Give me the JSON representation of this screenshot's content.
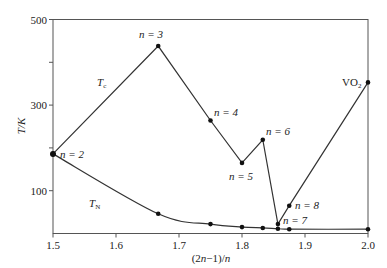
{
  "chart_data": {
    "type": "line",
    "title": "",
    "xlabel": "(2n−1)/n",
    "ylabel": "T/K",
    "xlim": [
      1.5,
      2.0
    ],
    "ylim": [
      0,
      500
    ],
    "xticks": [
      1.5,
      1.6,
      1.7,
      1.8,
      1.9,
      2.0
    ],
    "xtick_labels": [
      "1.5",
      "1.6",
      "1.7",
      "1.8",
      "1.9",
      "2.0"
    ],
    "yticks": [
      100,
      200,
      300,
      400,
      500
    ],
    "ytick_labels": [
      "100",
      "",
      "300",
      "",
      "500"
    ],
    "grid": false,
    "legend": "none (inline labels)",
    "series": [
      {
        "name": "T_c",
        "label_main": "T",
        "label_sub": "c",
        "x": [
          1.5,
          1.667,
          1.75,
          1.8,
          1.833,
          1.857,
          1.875,
          2.0
        ],
        "y": [
          186,
          438,
          264,
          165,
          219,
          22,
          65,
          353
        ],
        "point_labels": [
          "n = 2",
          "n = 3",
          "n = 4",
          "n = 5",
          "n = 6",
          "n = 7",
          "n = 8",
          "VO2"
        ]
      },
      {
        "name": "T_N",
        "label_main": "T",
        "label_sub": "N",
        "x": [
          1.5,
          1.667,
          1.75,
          1.8,
          1.833,
          1.857,
          1.875,
          2.0
        ],
        "y": [
          186,
          46,
          22,
          15,
          13,
          11,
          10,
          10
        ]
      }
    ],
    "annotations": [
      {
        "text": "n = 2",
        "x": 1.5,
        "y": 186
      },
      {
        "text": "n = 3",
        "x": 1.667,
        "y": 438
      },
      {
        "text": "n = 4",
        "x": 1.75,
        "y": 264
      },
      {
        "text": "n = 5",
        "x": 1.8,
        "y": 165
      },
      {
        "text": "n = 6",
        "x": 1.833,
        "y": 219
      },
      {
        "text": "n = 7",
        "x": 1.857,
        "y": 22
      },
      {
        "text": "n = 8",
        "x": 1.875,
        "y": 65
      },
      {
        "text": "VO2",
        "x": 2.0,
        "y": 353
      }
    ]
  },
  "labels": {
    "ylabel": "T/K",
    "xlabel_pre": "(2",
    "xlabel_n1": "n",
    "xlabel_mid": "−1)/",
    "xlabel_n2": "n",
    "tc_main": "T",
    "tc_sub": "c",
    "tn_main": "T",
    "tn_sub": "N",
    "n2": "n = 2",
    "n3": "n = 3",
    "n4": "n = 4",
    "n5": "n = 5",
    "n6": "n = 6",
    "n7": "n = 7",
    "n8": "n = 8",
    "vo2_main": "VO",
    "vo2_sub": "2"
  }
}
